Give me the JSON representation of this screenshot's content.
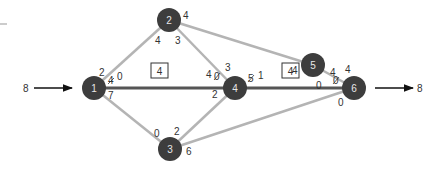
{
  "diagram": {
    "type": "network-flow",
    "source_flow": "8",
    "sink_flow": "8",
    "colors": {
      "node_fill": "#3d3d3d",
      "node_text": "#e8e8e8",
      "edge_light": "#b4b4b4",
      "edge_dark": "#555555",
      "label": "#333333"
    },
    "nodes": [
      {
        "id": "1",
        "label": "1"
      },
      {
        "id": "2",
        "label": "2"
      },
      {
        "id": "3",
        "label": "3"
      },
      {
        "id": "4",
        "label": "4"
      },
      {
        "id": "5",
        "label": "5"
      },
      {
        "id": "6",
        "label": "6"
      }
    ],
    "edges": [
      {
        "from": "1",
        "to": "2",
        "style": "light"
      },
      {
        "from": "1",
        "to": "4",
        "style": "dark"
      },
      {
        "from": "1",
        "to": "3",
        "style": "light"
      },
      {
        "from": "2",
        "to": "4",
        "style": "light"
      },
      {
        "from": "2",
        "to": "5",
        "style": "light"
      },
      {
        "from": "3",
        "to": "4",
        "style": "light"
      },
      {
        "from": "3",
        "to": "6",
        "style": "light"
      },
      {
        "from": "4",
        "to": "6",
        "style": "dark"
      },
      {
        "from": "5",
        "to": "6",
        "style": "light"
      }
    ],
    "boxed_labels": [
      "4",
      "4"
    ],
    "capacity_labels": {
      "n1_top": "2",
      "n1_right_struck": "4",
      "n1_right": "0",
      "n1_bottom": "7",
      "n2_right": "4",
      "n2_bottom_left": "4",
      "n2_bottom_right": "3",
      "n3_top_left": "0",
      "n3_top_right": "2",
      "n3_right": "6",
      "n4_left": "4",
      "n4_left_struck": "0",
      "n4_top": "3",
      "n4_bottom_left": "2",
      "n4_right_struck": "5",
      "n4_right": "1",
      "n5_left": "4",
      "n5_bottom": "0",
      "n6_left": "4",
      "n6_left_struck": "0",
      "n6_top": "4",
      "n6_bottom": "0"
    }
  }
}
